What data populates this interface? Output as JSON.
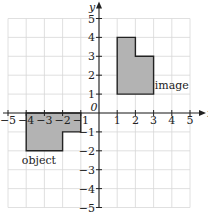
{
  "diagram": {
    "type": "coordinate-grid-translation",
    "x_range": [
      -5,
      5
    ],
    "y_range": [
      -5,
      5
    ],
    "x_axis_label": "x",
    "y_axis_label": "y",
    "origin_label": "0",
    "x_ticks": [
      {
        "value": -5,
        "label": "−5"
      },
      {
        "value": -4,
        "label": "−4"
      },
      {
        "value": -3,
        "label": "−3"
      },
      {
        "value": -2,
        "label": "−2"
      },
      {
        "value": -1,
        "label": "−1"
      },
      {
        "value": 1,
        "label": "1"
      },
      {
        "value": 2,
        "label": "2"
      },
      {
        "value": 3,
        "label": "3"
      },
      {
        "value": 4,
        "label": "4"
      },
      {
        "value": 5,
        "label": "5"
      }
    ],
    "y_ticks": [
      {
        "value": 5,
        "label": "5"
      },
      {
        "value": 4,
        "label": "4"
      },
      {
        "value": 3,
        "label": "3"
      },
      {
        "value": 2,
        "label": "2"
      },
      {
        "value": 1,
        "label": "1"
      },
      {
        "value": -1,
        "label": "−1"
      },
      {
        "value": -2,
        "label": "−2"
      },
      {
        "value": -3,
        "label": "−3"
      },
      {
        "value": -4,
        "label": "−4"
      },
      {
        "value": -5,
        "label": "−5"
      }
    ],
    "shapes": [
      {
        "name": "object",
        "label": "object",
        "vertices": [
          [
            -4,
            0
          ],
          [
            -1,
            0
          ],
          [
            -1,
            -1
          ],
          [
            -2,
            -1
          ],
          [
            -2,
            -2
          ],
          [
            -4,
            -2
          ]
        ],
        "label_at": [
          -3.3,
          -2.5
        ]
      },
      {
        "name": "image",
        "label": "image",
        "vertices": [
          [
            1,
            1
          ],
          [
            3,
            1
          ],
          [
            3,
            3
          ],
          [
            2,
            3
          ],
          [
            2,
            4
          ],
          [
            1,
            4
          ]
        ],
        "label_at": [
          4,
          1.5
        ]
      }
    ],
    "colors": {
      "grid": "#d8d8d8",
      "axis": "#222222",
      "shape_fill": "#b3b3b3",
      "shape_stroke": "#222222"
    }
  }
}
